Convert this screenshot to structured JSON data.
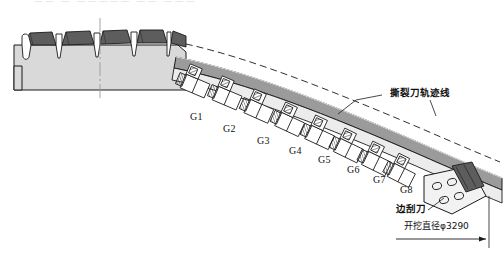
{
  "figure": {
    "kind": "engineering-cross-section",
    "title_strip": "—— — ————— —— ———"
  },
  "annotations": {
    "trajectory_label": "撕裂刀轨迹线",
    "side_scraper_label": "边刮刀",
    "dimension_label": "开挖直径φ3290"
  },
  "cutter_groups": [
    {
      "id": "G1",
      "label": "G1",
      "x": 190,
      "y": 112
    },
    {
      "id": "G2",
      "label": "G2",
      "x": 223,
      "y": 124
    },
    {
      "id": "G3",
      "label": "G3",
      "x": 257,
      "y": 136
    },
    {
      "id": "G4",
      "label": "G4",
      "x": 289,
      "y": 146
    },
    {
      "id": "G5",
      "label": "G5",
      "x": 318,
      "y": 155
    },
    {
      "id": "G6",
      "label": "G6",
      "x": 347,
      "y": 165
    },
    {
      "id": "G7",
      "label": "G7",
      "x": 373,
      "y": 175
    },
    {
      "id": "G8",
      "label": "G8",
      "x": 400,
      "y": 185
    }
  ],
  "colors": {
    "tooth_fill": "#5d5d5d",
    "body_fill": "#d9d9d9",
    "band_fill": "#9b9b9b",
    "outline": "#1a1a1a",
    "block_fill": "#ffffff",
    "hatch": "#2a2a2a",
    "paper": "#ffffff"
  }
}
